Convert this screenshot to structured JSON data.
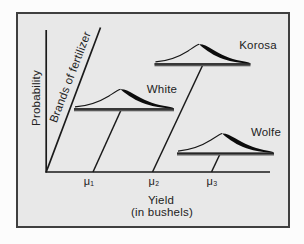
{
  "figure": {
    "background_color": "#e8e8e8",
    "frame_border_color": "#3f3f3f",
    "line_color": "#1a1a1a",
    "baseline_bar_color": "#555555",
    "axes": {
      "y_axis_label": "Probability",
      "x_axis_label": "Yield",
      "x_axis_sublabel": "(in bushels)",
      "diagonal_axis_label": "Brands of fertilizer",
      "x_tick_labels": [
        "μ₁",
        "μ₂",
        "μ₃"
      ]
    },
    "distributions": [
      {
        "name": "White",
        "mean_tick": "μ₁"
      },
      {
        "name": "Korosa",
        "mean_tick": "μ₂"
      },
      {
        "name": "Wolfe",
        "mean_tick": "μ₃"
      }
    ]
  }
}
